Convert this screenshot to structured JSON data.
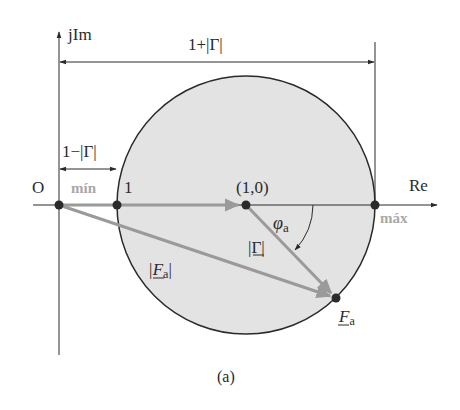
{
  "figure": {
    "caption": "(a)",
    "axes": {
      "imag_label": "jIm",
      "real_label": "Re",
      "origin_label": "O"
    },
    "points": {
      "one_label": "1",
      "center_label": "(1,0)",
      "fa_label": "F",
      "fa_sub": "a"
    },
    "annotations": {
      "max_dim": "1+|Γ|",
      "min_dim": "1−|Γ|",
      "min_label": "mín",
      "max_label": "máx",
      "gamma_mag": "|Γ|",
      "fa_mag": "|F",
      "fa_mag_sub": "a",
      "fa_mag_close": "|",
      "phi": "φ",
      "phi_sub": "a"
    },
    "colors": {
      "circle_fill": "#e3e3e3",
      "stroke": "#2a2a2a",
      "vector_gray": "#9a9a9a",
      "label_gray": "#a8a8a8"
    }
  }
}
